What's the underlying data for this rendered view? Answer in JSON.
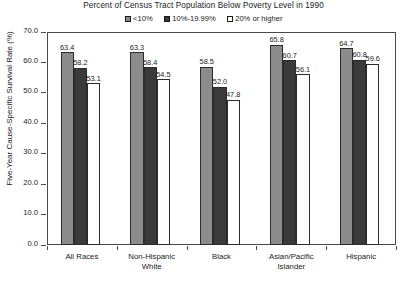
{
  "chart_data": {
    "type": "bar",
    "title": "Percent of Census Tract Population Below Poverty Level in 1990",
    "xlabel": "",
    "ylabel": "Five-Year Cause-Specific Survival Rate (%)",
    "ylim": [
      0.0,
      70.0
    ],
    "ytick_step": 10.0,
    "ytick_labels": [
      "0.0",
      "10.0",
      "20.0",
      "30.0",
      "40.0",
      "50.0",
      "60.0",
      "70.0"
    ],
    "ytick_values": [
      0.0,
      10.0,
      20.0,
      30.0,
      40.0,
      50.0,
      60.0,
      70.0
    ],
    "grid": false,
    "legend_position": "top-center",
    "categories": [
      "All Races",
      "Non-Hispanic White",
      "Black",
      "Asian/Pacific Islander",
      "Hispanic"
    ],
    "category_lines": [
      [
        "All Races"
      ],
      [
        "Non-Hispanic",
        "White"
      ],
      [
        "Black"
      ],
      [
        "Asian/Pacific",
        "Islander"
      ],
      [
        "Hispanic"
      ]
    ],
    "series": [
      {
        "name": "<10%",
        "color": "#8c8c8c",
        "values": [
          63.4,
          63.3,
          58.5,
          65.8,
          64.7
        ],
        "labels": [
          "63.4",
          "63.3",
          "58.5",
          "65.8",
          "64.7"
        ]
      },
      {
        "name": "10%-19.99%",
        "color": "#3a3a3a",
        "values": [
          58.2,
          58.4,
          52.0,
          60.7,
          60.8
        ],
        "labels": [
          "58.2",
          "58.4",
          "52.0",
          "60.7",
          "60.8"
        ]
      },
      {
        "name": "20% or higher",
        "color": "#ffffff",
        "values": [
          53.1,
          54.5,
          47.8,
          56.1,
          59.6
        ],
        "labels": [
          "53.1",
          "54.5",
          "47.8",
          "56.1",
          "59.6"
        ]
      }
    ]
  },
  "legend": {
    "items": [
      {
        "label": "<10%",
        "color": "#8c8c8c"
      },
      {
        "label": "10%-19.99%",
        "color": "#3a3a3a"
      },
      {
        "label": "20% or higher",
        "color": "#ffffff"
      }
    ]
  },
  "colors": {
    "series_1": "#8c8c8c",
    "series_2": "#3a3a3a",
    "series_3": "#ffffff",
    "axis": "#4a4a4a",
    "text": "#1a1a1a",
    "background": "#ffffff"
  }
}
